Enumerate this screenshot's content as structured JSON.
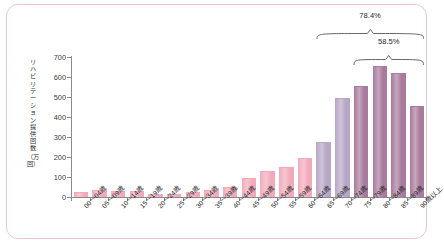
{
  "chart_data": {
    "type": "bar",
    "title": "",
    "xlabel": "",
    "ylabel": "リハビリテーション提供回数（万回）",
    "ylabel_chars": [
      "リ",
      "ハ",
      "ビ",
      "リ",
      "テ",
      "ー",
      "シ",
      "ョ",
      "ン",
      "提",
      "供",
      "回",
      "数"
    ],
    "ylabel_unit": "（万回）",
    "ylim": [
      0,
      700
    ],
    "yticks": [
      0,
      100,
      200,
      300,
      400,
      500,
      600,
      700
    ],
    "grid": false,
    "legend": "none",
    "categories": [
      "00〜04歳",
      "05〜09歳",
      "10〜14歳",
      "15〜19歳",
      "20〜24歳",
      "25〜29歳",
      "30〜34歳",
      "35〜39歳",
      "40〜44歳",
      "45〜49歳",
      "50〜54歳",
      "55〜59歳",
      "60〜64歳",
      "65〜69歳",
      "70〜74歳",
      "75〜79歳",
      "80〜84歳",
      "85〜89歳",
      "90歳以上"
    ],
    "values": [
      18,
      28,
      27,
      25,
      12,
      12,
      18,
      28,
      47,
      90,
      127,
      147,
      190,
      272,
      490,
      548,
      650,
      615,
      448
    ],
    "bar_colors": [
      "#f2aabb",
      "#f2aabb",
      "#f2aabb",
      "#f2aabb",
      "#f2aabb",
      "#f2aabb",
      "#f2aabb",
      "#f2aabb",
      "#f2aabb",
      "#f2aabb",
      "#f2aabb",
      "#f2aabb",
      "#f2aabb",
      "#b7a6c6",
      "#b7a6c6",
      "#a87a9d",
      "#a87a9d",
      "#a87a9d",
      "#a87a9d"
    ],
    "annotations": [
      {
        "label": "78.4%",
        "from": "65〜69歳",
        "to": "90歳以上",
        "from_index": 13,
        "to_index": 18
      },
      {
        "label": "58.5%",
        "from": "75〜79歳",
        "to": "90歳以上",
        "from_index": 15,
        "to_index": 18
      }
    ],
    "colors": {
      "pink": "#f2aabb",
      "light_purple": "#b7a6c6",
      "mauve": "#a87a9d",
      "axis": "#8a8a8a",
      "frame_border": "#e9c7cf",
      "text": "#262626"
    }
  }
}
